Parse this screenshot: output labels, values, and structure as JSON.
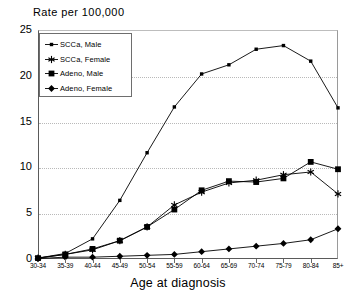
{
  "chart_data": {
    "type": "line",
    "title": "",
    "ylabel": "Rate per 100,000",
    "xlabel": "Age at diagnosis",
    "ylim": [
      0,
      25
    ],
    "yticks": [
      0,
      5,
      10,
      15,
      20,
      25
    ],
    "grid": true,
    "legend_position": "top-left",
    "categories": [
      "30-34",
      "35-39",
      "40-44",
      "45-49",
      "50-54",
      "55-59",
      "60-64",
      "65-69",
      "70-74",
      "75-79",
      "80-84",
      "85+"
    ],
    "series": [
      {
        "name": "SCCa, Male",
        "marker": "small-square",
        "color": "#000000",
        "values": [
          0.1,
          0.6,
          2.2,
          6.4,
          11.6,
          16.6,
          20.2,
          21.2,
          22.9,
          23.3,
          21.6,
          16.5
        ]
      },
      {
        "name": "SCCa, Female",
        "marker": "asterisk",
        "color": "#000000",
        "values": [
          0.1,
          0.5,
          1.0,
          2.0,
          3.5,
          5.9,
          7.3,
          8.3,
          8.6,
          9.2,
          9.5,
          7.1
        ]
      },
      {
        "name": "Adeno, Male",
        "marker": "filled-square",
        "color": "#000000",
        "values": [
          0.1,
          0.5,
          1.1,
          2.0,
          3.5,
          5.4,
          7.5,
          8.5,
          8.4,
          8.8,
          10.6,
          9.8
        ]
      },
      {
        "name": "Adeno, Female",
        "marker": "filled-diamond",
        "color": "#000000",
        "values": [
          0.05,
          0.2,
          0.2,
          0.3,
          0.4,
          0.5,
          0.8,
          1.1,
          1.4,
          1.7,
          2.1,
          3.3
        ]
      }
    ]
  },
  "legend": {
    "items": [
      {
        "label": "SCCa, Male",
        "marker": "small-square"
      },
      {
        "label": "SCCa, Female",
        "marker": "asterisk"
      },
      {
        "label": "Adeno, Male",
        "marker": "filled-square"
      },
      {
        "label": "Adeno, Female",
        "marker": "filled-diamond"
      }
    ]
  }
}
